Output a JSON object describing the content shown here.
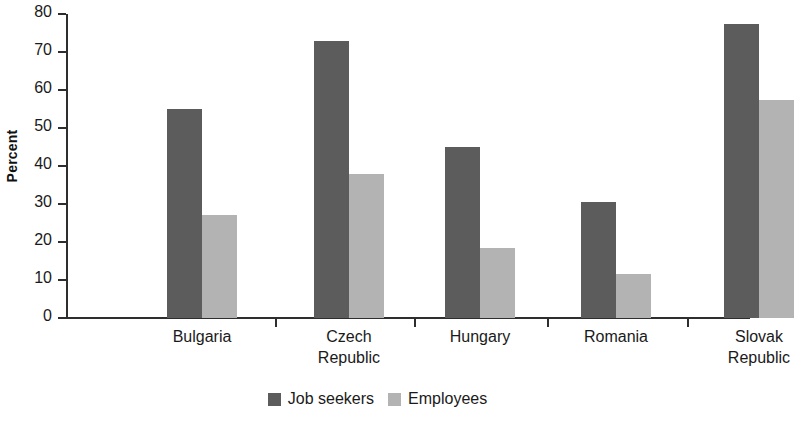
{
  "chart_data": {
    "type": "bar",
    "title": "",
    "subtitle": "",
    "xlabel": "",
    "ylabel": "Percent",
    "ylim": [
      0,
      80
    ],
    "yticks": [
      0,
      10,
      20,
      30,
      40,
      50,
      60,
      70,
      80
    ],
    "ytick_labels": [
      "0",
      "10",
      "20",
      "30",
      "40",
      "50",
      "60",
      "70",
      "80"
    ],
    "grid": false,
    "legend_position": "bottom-center",
    "categories": [
      "Bulgaria",
      "Czech\nRepublic",
      "Hungary",
      "Romania",
      "Slovak\nRepublic"
    ],
    "series": [
      {
        "name": "Job seekers",
        "color": "#5c5c5c",
        "values": [
          55,
          73,
          45,
          30.5,
          77.5
        ]
      },
      {
        "name": "Employees",
        "color": "#b3b3b3",
        "values": [
          27,
          38,
          18.5,
          11.5,
          57.5
        ]
      }
    ]
  },
  "legend": {
    "items": [
      {
        "label": "Job seekers",
        "swatch": "dark"
      },
      {
        "label": "Employees",
        "swatch": "light"
      }
    ]
  },
  "colors": {
    "job_seekers": "#5c5c5c",
    "employees": "#b3b3b3",
    "axis": "#2e2e2e",
    "text": "#1a1a1a",
    "background": "#ffffff"
  }
}
